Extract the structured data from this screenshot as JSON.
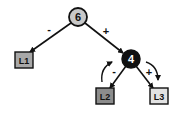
{
  "diagram": {
    "type": "binary-tree",
    "nodes": [
      {
        "id": "n6",
        "label": "6",
        "kind": "internal",
        "shape": "circle",
        "fill": "#c8c8c8",
        "text_color": "#111111",
        "cx": 78,
        "cy": 17
      },
      {
        "id": "n4",
        "label": "4",
        "kind": "internal",
        "shape": "circle",
        "fill": "#111111",
        "text_color": "#ffffff",
        "cx": 131,
        "cy": 59
      },
      {
        "id": "L1",
        "label": "L1",
        "kind": "leaf",
        "shape": "square",
        "fill": "#a8a8a8",
        "x": 15,
        "y": 52
      },
      {
        "id": "L2",
        "label": "L2",
        "kind": "leaf",
        "shape": "square",
        "fill": "#8c8c8c",
        "x": 96,
        "y": 88
      },
      {
        "id": "L3",
        "label": "L3",
        "kind": "leaf",
        "shape": "square",
        "fill": "#e2e2e2",
        "x": 150,
        "y": 88
      }
    ],
    "edges": [
      {
        "from": "6",
        "to": "L1",
        "label": "-"
      },
      {
        "from": "6",
        "to": "4",
        "label": "+"
      },
      {
        "from": "4",
        "to": "L2",
        "label": "-"
      },
      {
        "from": "4",
        "to": "L3",
        "label": "+"
      }
    ],
    "rotation_arrows": [
      {
        "side": "left",
        "direction": "up"
      },
      {
        "side": "right",
        "direction": "down"
      }
    ]
  },
  "labels": {
    "n6": "6",
    "n4": "4",
    "L1": "L1",
    "L2": "L2",
    "L3": "L3",
    "e_6_L1": "-",
    "e_6_4": "+",
    "e_4_L2": "-",
    "e_4_L3": "+"
  }
}
